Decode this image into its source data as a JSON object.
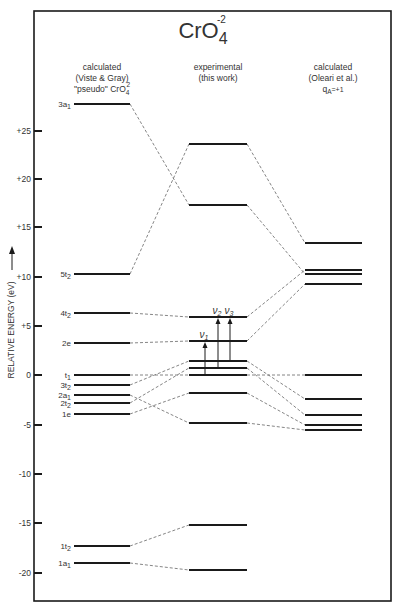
{
  "title": {
    "main": "CrO",
    "sub": "4",
    "sup": "-2"
  },
  "columns": [
    {
      "id": "left",
      "lines": [
        "calculated",
        "(Viste & Gray)",
        "\"pseudo\" CrO"
      ],
      "pseudo_sub": "4",
      "pseudo_sup": "2",
      "x1": 74,
      "x2": 130
    },
    {
      "id": "middle",
      "lines": [
        "experimental",
        "(this work)"
      ],
      "x1": 189,
      "x2": 247
    },
    {
      "id": "right",
      "lines": [
        "calculated",
        "(Oleari et al.)",
        "q"
      ],
      "q_sub": "A",
      "q_rest": "=+1",
      "x1": 305,
      "x2": 362
    }
  ],
  "axis": {
    "label": "RELATIVE ENERGY (eV)",
    "ticks": [
      {
        "label": "+25",
        "y": 131
      },
      {
        "label": "+20",
        "y": 179
      },
      {
        "label": "+15",
        "y": 227
      },
      {
        "label": "+10",
        "y": 277
      },
      {
        "label": "+5",
        "y": 326
      },
      {
        "label": "0",
        "y": 375
      },
      {
        "label": "-5",
        "y": 425
      },
      {
        "label": "-10",
        "y": 474
      },
      {
        "label": "-15",
        "y": 523
      },
      {
        "label": "-20",
        "y": 573
      }
    ]
  },
  "levels": {
    "left": [
      {
        "name": "3a",
        "sub": "1",
        "energy": 27.5,
        "y": 104
      },
      {
        "name": "5t",
        "sub": "2",
        "energy": 10.2,
        "y": 274
      },
      {
        "name": "4t",
        "sub": "2",
        "energy": 6.3,
        "y": 313
      },
      {
        "name": "2e",
        "sub": "",
        "energy": 3.2,
        "y": 343
      },
      {
        "name": "t",
        "sub": "1",
        "energy": 0.0,
        "y": 375
      },
      {
        "name": "3t",
        "sub": "2",
        "energy": -1.0,
        "y": 385
      },
      {
        "name": "2a",
        "sub": "1",
        "energy": -2.0,
        "y": 395
      },
      {
        "name": "2t",
        "sub": "2",
        "energy": -2.8,
        "y": 403
      },
      {
        "name": "1e",
        "sub": "",
        "energy": -3.9,
        "y": 414
      },
      {
        "name": "1t",
        "sub": "2",
        "energy": -17.3,
        "y": 546
      },
      {
        "name": "1a",
        "sub": "1",
        "energy": -19.0,
        "y": 563
      }
    ],
    "middle": [
      {
        "energy": 23.4,
        "y": 144
      },
      {
        "energy": 14.1,
        "y": 205
      },
      {
        "energy": 5.9,
        "y": 317
      },
      {
        "energy": 3.4,
        "y": 341
      },
      {
        "energy": 1.4,
        "y": 361
      },
      {
        "energy": 0.7,
        "y": 368
      },
      {
        "energy": 0.0,
        "y": 375
      },
      {
        "energy": -1.8,
        "y": 393
      },
      {
        "energy": -4.8,
        "y": 423
      },
      {
        "energy": -15.1,
        "y": 525
      },
      {
        "energy": -19.7,
        "y": 570
      }
    ],
    "right": [
      {
        "energy": 13.4,
        "y": 243
      },
      {
        "energy": 10.7,
        "y": 270
      },
      {
        "energy": 10.3,
        "y": 274
      },
      {
        "energy": 9.3,
        "y": 284
      },
      {
        "energy": 0.0,
        "y": 375
      },
      {
        "energy": -2.4,
        "y": 399
      },
      {
        "energy": -4.0,
        "y": 415
      },
      {
        "energy": -5.1,
        "y": 425
      },
      {
        "energy": -5.6,
        "y": 430
      }
    ]
  },
  "connections": [
    {
      "from": [
        "left",
        0
      ],
      "to": [
        "middle",
        1
      ]
    },
    {
      "from": [
        "left",
        1
      ],
      "to": [
        "middle",
        0
      ]
    },
    {
      "from": [
        "left",
        2
      ],
      "to": [
        "middle",
        2
      ]
    },
    {
      "from": [
        "left",
        3
      ],
      "to": [
        "middle",
        3
      ]
    },
    {
      "from": [
        "left",
        4
      ],
      "to": [
        "middle",
        6
      ]
    },
    {
      "from": [
        "left",
        5
      ],
      "to": [
        "middle",
        4
      ]
    },
    {
      "from": [
        "left",
        6
      ],
      "to": [
        "middle",
        8
      ]
    },
    {
      "from": [
        "left",
        7
      ],
      "to": [
        "middle",
        5
      ]
    },
    {
      "from": [
        "left",
        8
      ],
      "to": [
        "middle",
        7
      ]
    },
    {
      "from": [
        "left",
        9
      ],
      "to": [
        "middle",
        9
      ]
    },
    {
      "from": [
        "left",
        10
      ],
      "to": [
        "middle",
        10
      ]
    },
    {
      "from": [
        "middle",
        0
      ],
      "to": [
        "right",
        0
      ]
    },
    {
      "from": [
        "middle",
        1
      ],
      "to": [
        "right",
        2
      ]
    },
    {
      "from": [
        "middle",
        2
      ],
      "to": [
        "right",
        1
      ]
    },
    {
      "from": [
        "middle",
        3
      ],
      "to": [
        "right",
        3
      ]
    },
    {
      "from": [
        "middle",
        6
      ],
      "to": [
        "right",
        4
      ]
    },
    {
      "from": [
        "middle",
        4
      ],
      "to": [
        "right",
        5
      ]
    },
    {
      "from": [
        "middle",
        5
      ],
      "to": [
        "right",
        6
      ]
    },
    {
      "from": [
        "middle",
        7
      ],
      "to": [
        "right",
        7
      ]
    },
    {
      "from": [
        "middle",
        8
      ],
      "to": [
        "right",
        8
      ]
    }
  ],
  "transitions": [
    {
      "label": "ν",
      "sub": "1",
      "x": 205,
      "from_y": 375,
      "to_y": 341
    },
    {
      "label": "ν",
      "sub": "2",
      "x": 218,
      "from_y": 368,
      "to_y": 317
    },
    {
      "label": "ν",
      "sub": "3",
      "x": 230,
      "from_y": 361,
      "to_y": 317
    }
  ],
  "frame": {
    "x": 34,
    "y": 11,
    "w": 357,
    "h": 590
  },
  "colors": {
    "line": "#1a1a1a",
    "dash": "#666666",
    "text": "#333333"
  }
}
